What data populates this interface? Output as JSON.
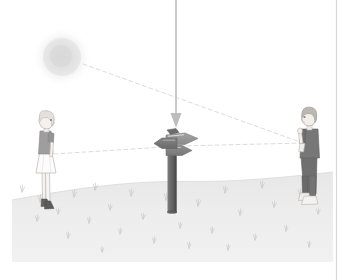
{
  "figure": {
    "canvas": {
      "width": 345,
      "height": 280
    },
    "background_color": "#ffffff",
    "border": {
      "right_rule_color": "#d8d8d8",
      "right_rule_x": 336,
      "bottom_edge_y": 262
    }
  },
  "sky": {
    "name": "sky-background",
    "color": "#ffffff"
  },
  "sun": {
    "name": "sun-light-source",
    "label": "sun",
    "center_x": 62,
    "center_y": 57,
    "radius": 26,
    "core_color": "#dcdcdc",
    "edge_color": "#ffffff"
  },
  "ground": {
    "name": "ground-plane",
    "label": "ground",
    "fill_color": "#ebebeb",
    "top_y": 178,
    "bottom_y": 262,
    "left_x": 12,
    "right_x": 333,
    "grass_color": "#c9c9c9",
    "grass_tufts": [
      {
        "x": 22,
        "y": 192
      },
      {
        "x": 40,
        "y": 202
      },
      {
        "x": 37,
        "y": 221
      },
      {
        "x": 58,
        "y": 214
      },
      {
        "x": 74,
        "y": 197
      },
      {
        "x": 89,
        "y": 223
      },
      {
        "x": 95,
        "y": 190
      },
      {
        "x": 110,
        "y": 210
      },
      {
        "x": 120,
        "y": 234
      },
      {
        "x": 131,
        "y": 196
      },
      {
        "x": 143,
        "y": 219
      },
      {
        "x": 154,
        "y": 243
      },
      {
        "x": 166,
        "y": 200
      },
      {
        "x": 180,
        "y": 228
      },
      {
        "x": 189,
        "y": 248
      },
      {
        "x": 198,
        "y": 206
      },
      {
        "x": 212,
        "y": 233
      },
      {
        "x": 225,
        "y": 193
      },
      {
        "x": 228,
        "y": 250
      },
      {
        "x": 240,
        "y": 215
      },
      {
        "x": 255,
        "y": 240
      },
      {
        "x": 262,
        "y": 188
      },
      {
        "x": 274,
        "y": 207
      },
      {
        "x": 286,
        "y": 231
      },
      {
        "x": 300,
        "y": 196
      },
      {
        "x": 309,
        "y": 247
      },
      {
        "x": 318,
        "y": 214
      },
      {
        "x": 68,
        "y": 238
      },
      {
        "x": 102,
        "y": 252
      },
      {
        "x": 172,
        "y": 186
      }
    ]
  },
  "incident_ray": {
    "name": "incident-light-ray",
    "label": "incident ray from above",
    "color": "#bdbdbd",
    "x": 176,
    "y_start": 0,
    "y_end": 128,
    "arrowhead_width": 11,
    "arrowhead_height": 15,
    "line_width": 1.6
  },
  "sight_lines": [
    {
      "name": "sight-line-sun-to-boy",
      "label": "ray from sun past signpost to the boy",
      "color": "#dcdcdc",
      "dash": "4 3",
      "x1": 83,
      "y1": 64,
      "x2": 303,
      "y2": 143
    },
    {
      "name": "sight-line-girl-to-signpost",
      "label": "line of sight from the girl to the signpost",
      "color": "#dcdcdc",
      "dash": "4 3",
      "x1": 54,
      "y1": 154,
      "x2": 180,
      "y2": 146
    },
    {
      "name": "sight-line-signpost-to-boy",
      "label": "line of sight from the signpost to the boy",
      "color": "#dcdcdc",
      "dash": "4 3",
      "x1": 180,
      "y1": 146,
      "x2": 303,
      "y2": 143
    }
  ],
  "signpost": {
    "name": "signpost",
    "label": "signpost",
    "post": {
      "x": 167,
      "y_top": 148,
      "width": 9,
      "height": 64,
      "color": "#6e6e6e",
      "shadow_color": "#565656"
    },
    "arms": [
      {
        "name": "sign-arm-right-upper",
        "direction": "right",
        "color": "#949494",
        "edge_color": "#7a7a7a"
      },
      {
        "name": "sign-arm-right-lower",
        "direction": "right",
        "color": "#8a8a8a",
        "edge_color": "#6f6f6f"
      },
      {
        "name": "sign-arm-left",
        "direction": "left",
        "color": "#7c7c7c",
        "edge_color": "#636363"
      }
    ],
    "highlight_color": "#efefef"
  },
  "figures": [
    {
      "name": "observer-girl",
      "label": "girl observer",
      "position": "left",
      "base_x": 46,
      "ground_y": 211,
      "skin_color": "#f2efed",
      "outline_color": "#b9b3b0",
      "hair_color": "#e2dcd8",
      "shirt_color": "#9a9a9a",
      "skirt_color": "#fbfbfb",
      "skirt_outline": "#c4c0bd",
      "leg_color": "#f4f1ef",
      "shoe_color": "#5e5e5e"
    },
    {
      "name": "observer-boy",
      "label": "boy observer",
      "position": "right",
      "base_x": 310,
      "ground_y": 207,
      "skin_color": "#efeceb",
      "outline_color": "#b5afac",
      "hair_color": "#b9b3ae",
      "shirt_color": "#747474",
      "pants_color": "#6a6a6a",
      "shoe_color": "#eceae8",
      "shoe_outline": "#b5b0ad"
    }
  ]
}
